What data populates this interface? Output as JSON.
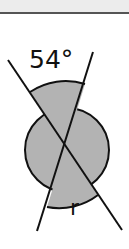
{
  "figure": {
    "angle_label": "54°",
    "unknown_label": "r",
    "colors": {
      "fill": "#b3b3b3",
      "stroke": "#111111",
      "top_band": "#ececec",
      "top_rule": "#555555"
    }
  }
}
